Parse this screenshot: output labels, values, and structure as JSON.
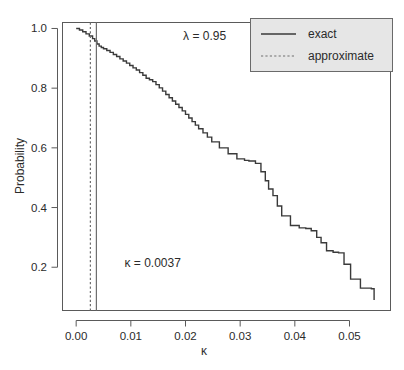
{
  "chart_data": {
    "type": "line",
    "title": "",
    "subtitle": "",
    "xlabel": "κ",
    "ylabel": "Probability",
    "xlim": [
      -0.0025,
      0.0575
    ],
    "ylim": [
      0.055,
      1.02
    ],
    "xticks": [
      0.0,
      0.01,
      0.02,
      0.03,
      0.04,
      0.05
    ],
    "xticklabels": [
      "0.00",
      "0.01",
      "0.02",
      "0.03",
      "0.04",
      "0.05"
    ],
    "yticks": [
      0.2,
      0.4,
      0.6,
      0.8,
      1.0
    ],
    "yticklabels": [
      "0.2",
      "0.4",
      "0.6",
      "0.8",
      "1.0"
    ],
    "grid": false,
    "legend_position": "top-right",
    "series": [
      {
        "name": "exact",
        "style": "solid",
        "color": "#3a3a3a",
        "step": "post",
        "x": [
          0.0,
          0.0006,
          0.0012,
          0.0018,
          0.0024,
          0.003,
          0.0034,
          0.0038,
          0.0042,
          0.0046,
          0.005,
          0.0056,
          0.0062,
          0.0068,
          0.0074,
          0.008,
          0.0086,
          0.0092,
          0.0098,
          0.0104,
          0.011,
          0.0116,
          0.0122,
          0.0128,
          0.0134,
          0.014,
          0.0146,
          0.0152,
          0.0158,
          0.0164,
          0.017,
          0.0176,
          0.0182,
          0.0188,
          0.0194,
          0.02,
          0.0206,
          0.0212,
          0.0218,
          0.0224,
          0.0232,
          0.024,
          0.0248,
          0.0262,
          0.0278,
          0.0294,
          0.0308,
          0.0316,
          0.0328,
          0.0338,
          0.0346,
          0.0352,
          0.036,
          0.0368,
          0.0376,
          0.0392,
          0.0408,
          0.042,
          0.043,
          0.044,
          0.0448,
          0.0458,
          0.047,
          0.048,
          0.049,
          0.0502,
          0.052,
          0.054,
          0.0545
        ],
        "y": [
          1.0,
          0.995,
          0.989,
          0.982,
          0.975,
          0.966,
          0.958,
          0.948,
          0.941,
          0.936,
          0.932,
          0.926,
          0.92,
          0.913,
          0.906,
          0.898,
          0.891,
          0.884,
          0.876,
          0.868,
          0.861,
          0.852,
          0.843,
          0.833,
          0.828,
          0.822,
          0.812,
          0.801,
          0.79,
          0.779,
          0.768,
          0.757,
          0.746,
          0.735,
          0.724,
          0.712,
          0.7,
          0.688,
          0.676,
          0.664,
          0.65,
          0.636,
          0.62,
          0.6,
          0.58,
          0.563,
          0.558,
          0.556,
          0.548,
          0.52,
          0.49,
          0.462,
          0.44,
          0.405,
          0.372,
          0.34,
          0.332,
          0.33,
          0.322,
          0.3,
          0.282,
          0.255,
          0.25,
          0.248,
          0.21,
          0.16,
          0.13,
          0.128,
          0.09
        ]
      }
    ],
    "reference_lines": [
      {
        "name": "exact-threshold",
        "orientation": "vertical",
        "value": 0.0037,
        "style": "solid",
        "color": "#6e6e6e"
      },
      {
        "name": "approximate-threshold",
        "orientation": "vertical",
        "value": 0.0026,
        "style": "dashed",
        "color": "#6e6e6e"
      }
    ],
    "annotations": [
      {
        "name": "lambda-annotation",
        "text": "λ = 0.95",
        "x": 0.0235,
        "y": 0.975
      },
      {
        "name": "kappa-annotation",
        "text": "κ = 0.0037",
        "x": 0.014,
        "y": 0.215
      }
    ]
  },
  "axes": {
    "x_title": "κ",
    "y_title": "Probability",
    "x_tick_labels": [
      "0.00",
      "0.01",
      "0.02",
      "0.03",
      "0.04",
      "0.05"
    ],
    "y_tick_labels": [
      "0.2",
      "0.4",
      "0.6",
      "0.8",
      "1.0"
    ]
  },
  "annotations": {
    "lambda": "λ = 0.95",
    "kappa": "κ = 0.0037"
  },
  "legend": {
    "entries": [
      {
        "label": "exact",
        "style": "solid"
      },
      {
        "label": "approximate",
        "style": "dashed"
      }
    ],
    "background_color": "#e6e6e6",
    "border_color": "#6a6a6a"
  },
  "colors": {
    "background": "#ffffff",
    "line": "#3a3a3a",
    "reference_line": "#6e6e6e",
    "axis": "#5a5a5a",
    "text": "#2b2b2b"
  }
}
